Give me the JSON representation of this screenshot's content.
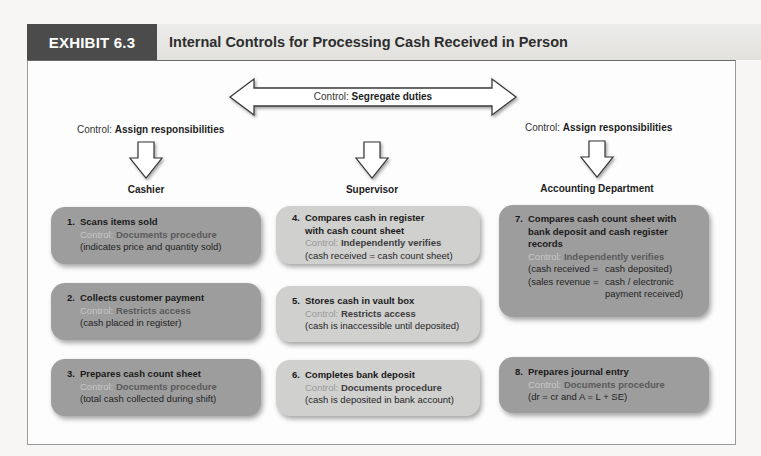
{
  "exhibit": {
    "tag": "EXHIBIT 6.3",
    "title": "Internal Controls for Processing Cash Received in Person"
  },
  "controls": {
    "prefix": "Control: ",
    "segregate": "Segregate duties",
    "assign_left": "Assign responsibilities",
    "assign_right": "Assign responsibilities"
  },
  "columns": [
    {
      "title": "Cashier"
    },
    {
      "title": "Supervisor"
    },
    {
      "title": "Accounting Department"
    }
  ],
  "steps": [
    {
      "num": "1.",
      "title": "Scans items sold",
      "title2": "",
      "title3": "",
      "control_label": "Control: ",
      "control": "Documents procedure",
      "note": "(indicates price and quantity sold)"
    },
    {
      "num": "2.",
      "title": "Collects customer payment",
      "title2": "",
      "title3": "",
      "control_label": "Control: ",
      "control": "Restricts access",
      "note": "(cash placed in register)"
    },
    {
      "num": "3.",
      "title": "Prepares cash count sheet",
      "title2": "",
      "title3": "",
      "control_label": "Control: ",
      "control": "Documents procedure",
      "note": "(total cash collected during shift)"
    },
    {
      "num": "4.",
      "title": "Compares cash in register",
      "title2": "with cash count sheet",
      "title3": "",
      "control_label": "Control: ",
      "control": "Independently verifies",
      "note": "(cash received = cash count sheet)"
    },
    {
      "num": "5.",
      "title": "Stores cash in vault box",
      "title2": "",
      "title3": "",
      "control_label": "Control: ",
      "control": "Restricts access",
      "note": "(cash is inaccessible until deposited)"
    },
    {
      "num": "6.",
      "title": "Completes bank deposit",
      "title2": "",
      "title3": "",
      "control_label": "Control: ",
      "control": "Documents procedure",
      "note": "(cash is deposited in bank account)"
    },
    {
      "num": "7.",
      "title": "Compares cash count sheet with",
      "title2": "bank deposit and cash register",
      "title3": "records",
      "control_label": "Control: ",
      "control": "Independently verifies",
      "pairs": [
        {
          "left": "(cash received =",
          "right": "cash deposited)",
          "right2": ""
        },
        {
          "left": "(sales revenue =",
          "right": "cash / electronic",
          "right2": "payment received)"
        }
      ]
    },
    {
      "num": "8.",
      "title": "Prepares journal entry",
      "title2": "",
      "title3": "",
      "control_label": "Control: ",
      "control": "Documents procedure",
      "note": "(dr = cr and A = L + SE)"
    }
  ],
  "colors": {
    "header_tag": "#4b4b4b",
    "header_bar": "#e6e5e2",
    "box_dark": "#9d9d9d",
    "box_light": "#d0d0cf"
  }
}
